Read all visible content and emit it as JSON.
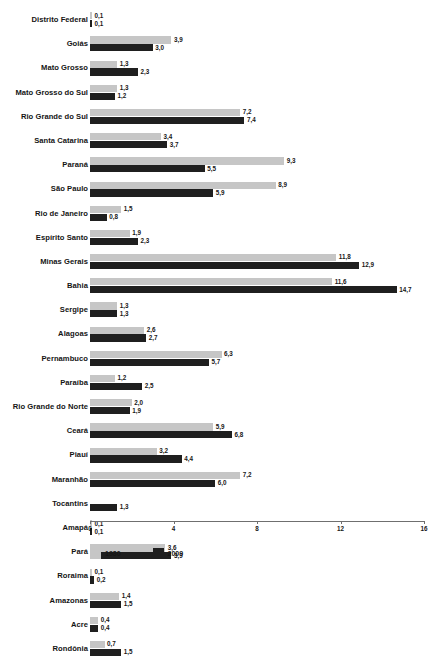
{
  "chart_data": {
    "type": "bar",
    "orientation": "horizontal",
    "title": "",
    "xlabel": "",
    "ylabel": "",
    "xlim": [
      0,
      16
    ],
    "xticks": [
      "0",
      "4",
      "8",
      "12",
      "16"
    ],
    "grid": false,
    "legend_position": "bottom-left",
    "decimal_separator": ",",
    "colors": {
      "series_1980": "#c6c6c6",
      "series_2009": "#1f1f1f",
      "axis": "#6f6f6f",
      "text": "#161616",
      "background": "#ffffff"
    },
    "categories": [
      "Distrito Federal",
      "Goiás",
      "Mato Grosso",
      "Mato Grosso do Sul",
      "Rio Grande do Sul",
      "Santa Catarina",
      "Paraná",
      "São Paulo",
      "Rio de Janeiro",
      "Espírito Santo",
      "Minas Gerais",
      "Bahia",
      "Sergipe",
      "Alagoas",
      "Pernambuco",
      "Paraíba",
      "Rio Grande do Norte",
      "Ceará",
      "Piauí",
      "Maranhão",
      "Tocantins",
      "Amapá",
      "Pará",
      "Roraima",
      "Amazonas",
      "Acre",
      "Rondônia"
    ],
    "series": [
      {
        "name": "1980",
        "values": [
          0.1,
          3.9,
          1.3,
          1.3,
          7.2,
          3.4,
          9.3,
          8.9,
          1.5,
          1.9,
          11.8,
          11.6,
          1.3,
          2.6,
          6.3,
          1.2,
          2.0,
          5.9,
          3.2,
          7.2,
          null,
          0.1,
          3.6,
          0.1,
          1.4,
          0.4,
          0.7
        ],
        "labels": [
          "0,1",
          "3,9",
          "1,3",
          "1,3",
          "7,2",
          "3,4",
          "9,3",
          "8,9",
          "1,5",
          "1,9",
          "11,8",
          "11,6",
          "1,3",
          "2,6",
          "6,3",
          "1,2",
          "2,0",
          "5,9",
          "3,2",
          "7,2",
          "",
          "0,1",
          "3,6",
          "0,1",
          "1,4",
          "0,4",
          "0,7"
        ]
      },
      {
        "name": "2009",
        "values": [
          0.1,
          3.0,
          2.3,
          1.2,
          7.4,
          3.7,
          5.5,
          5.9,
          0.8,
          2.3,
          12.9,
          14.7,
          1.3,
          2.7,
          5.7,
          2.5,
          1.9,
          6.8,
          4.4,
          6.0,
          1.3,
          0.1,
          3.9,
          0.2,
          1.5,
          0.4,
          1.5
        ],
        "labels": [
          "0,1",
          "3,0",
          "2,3",
          "1,2",
          "7,4",
          "3,7",
          "5,5",
          "5,9",
          "0,8",
          "2,3",
          "12,9",
          "14,7",
          "1,3",
          "2,7",
          "5,7",
          "2,5",
          "1,9",
          "6,8",
          "4,4",
          "6,0",
          "1,3",
          "0,1",
          "3,9",
          "0,2",
          "1,5",
          "0,4",
          "1,5"
        ]
      }
    ],
    "legend": [
      {
        "label": "1980",
        "color": "#c6c6c6"
      },
      {
        "label": "2009",
        "color": "#1f1f1f"
      }
    ]
  }
}
